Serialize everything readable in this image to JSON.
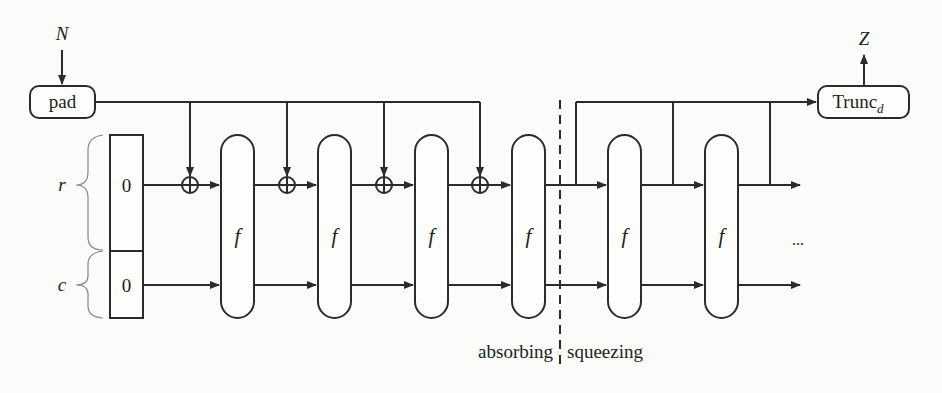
{
  "diagram": {
    "input_label": "N",
    "output_label": "Z",
    "pad_label": "pad",
    "trunc_label": "Trunc",
    "trunc_subscript": "d",
    "state": {
      "rate_label": "r",
      "capacity_label": "c",
      "rate_init": "0",
      "capacity_init": "0"
    },
    "function_label": "f",
    "function_blocks": [
      {
        "id": "f1",
        "label": "f",
        "phase": "absorbing"
      },
      {
        "id": "f2",
        "label": "f",
        "phase": "absorbing"
      },
      {
        "id": "f3",
        "label": "f",
        "phase": "absorbing"
      },
      {
        "id": "f4",
        "label": "f",
        "phase": "absorbing"
      },
      {
        "id": "f5",
        "label": "f",
        "phase": "squeezing"
      },
      {
        "id": "f6",
        "label": "f",
        "phase": "squeezing"
      }
    ],
    "xor_count": 4,
    "continuation": "...",
    "phases": {
      "absorbing": "absorbing",
      "squeezing": "squeezing"
    },
    "colors": {
      "line": "#2b2b2b",
      "background": "#fbfbf9",
      "brace": "#888888"
    }
  }
}
